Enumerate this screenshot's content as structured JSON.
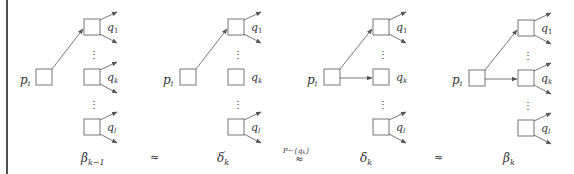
{
  "figure": {
    "diagrams": [
      {
        "id": "beta_k_minus_1",
        "caption_base": "β",
        "caption_sub": "k−1",
        "caption_prime": "",
        "source_label": "p",
        "source_sub": "i",
        "targets": [
          {
            "label": "q",
            "sub": "1",
            "incoming": true
          },
          {
            "label": "q",
            "sub": "k",
            "incoming": false
          },
          {
            "label": "q",
            "sub": "l",
            "incoming": false
          }
        ]
      },
      {
        "id": "delta_prime_k",
        "caption_base": "δ",
        "caption_sub": "k",
        "caption_prime": "′",
        "source_label": "p",
        "source_sub": "i",
        "targets": [
          {
            "label": "q",
            "sub": "1",
            "incoming": true
          },
          {
            "label": "q",
            "sub": "k",
            "incoming": false,
            "no_outgoing": true
          },
          {
            "label": "q",
            "sub": "l",
            "incoming": false
          }
        ]
      },
      {
        "id": "delta_k",
        "caption_base": "δ",
        "caption_sub": "k",
        "caption_prime": "",
        "source_label": "p",
        "source_sub": "i",
        "targets": [
          {
            "label": "q",
            "sub": "1",
            "incoming": true
          },
          {
            "label": "q",
            "sub": "k",
            "incoming": true
          },
          {
            "label": "q",
            "sub": "l",
            "incoming": false
          }
        ]
      },
      {
        "id": "beta_k",
        "caption_base": "β",
        "caption_sub": "k",
        "caption_prime": "",
        "source_label": "p",
        "source_sub": "i",
        "targets": [
          {
            "label": "q",
            "sub": "1",
            "incoming": true
          },
          {
            "label": "q",
            "sub": "k",
            "incoming": true
          },
          {
            "label": "q",
            "sub": "l",
            "incoming": false
          }
        ]
      }
    ],
    "relations": [
      {
        "symbol": "≈",
        "superscript": ""
      },
      {
        "symbol": "≈",
        "superscript": "P−{q",
        "superscript_sub": "k",
        "superscript_end": "}"
      },
      {
        "symbol": "≈",
        "superscript": ""
      }
    ],
    "ellipsis": "⋮",
    "colors": {
      "stroke": "#555555",
      "text": "#333333",
      "border": "#222222"
    }
  }
}
